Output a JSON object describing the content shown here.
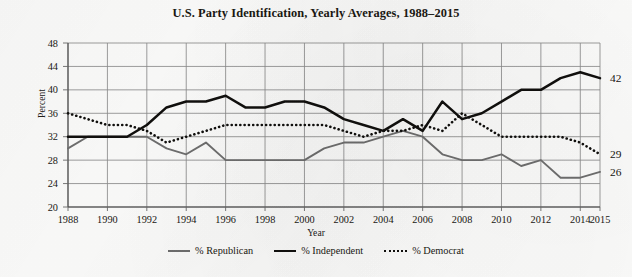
{
  "chart_data": {
    "type": "line",
    "title": "U.S. Party Identification, Yearly Averages, 1988–2015",
    "xlabel": "Year",
    "ylabel": "Percent",
    "ylim": [
      20,
      48
    ],
    "yticks": [
      20,
      24,
      28,
      32,
      36,
      40,
      44,
      48
    ],
    "xlim": [
      1988,
      2015
    ],
    "xticks": [
      1988,
      1990,
      1992,
      1994,
      1996,
      1998,
      2000,
      2002,
      2004,
      2006,
      2008,
      2010,
      2012,
      2014,
      2015
    ],
    "xtick_labels": [
      "1988",
      "1990",
      "1992",
      "1994",
      "1996",
      "1998",
      "2000",
      "2002",
      "2004",
      "2006",
      "2008",
      "2010",
      "2012",
      "2014",
      "2015"
    ],
    "grid": true,
    "legend_position": "bottom",
    "x": [
      1988,
      1989,
      1990,
      1991,
      1992,
      1993,
      1994,
      1995,
      1996,
      1997,
      1998,
      1999,
      2000,
      2001,
      2002,
      2003,
      2004,
      2005,
      2006,
      2007,
      2008,
      2009,
      2010,
      2011,
      2012,
      2013,
      2014,
      2015
    ],
    "series": [
      {
        "name": "% Republican",
        "color": "#6f6f6f",
        "style": "solid",
        "end_label": "26",
        "values": [
          30,
          32,
          32,
          32,
          32,
          30,
          29,
          31,
          28,
          28,
          28,
          28,
          28,
          30,
          31,
          31,
          32,
          33,
          32,
          29,
          28,
          28,
          29,
          27,
          28,
          25,
          25,
          26
        ]
      },
      {
        "name": "% Independent",
        "color": "#100f0d",
        "style": "solid",
        "end_label": "42",
        "values": [
          32,
          32,
          32,
          32,
          34,
          37,
          38,
          38,
          39,
          37,
          37,
          38,
          38,
          37,
          35,
          34,
          33,
          35,
          33,
          38,
          35,
          36,
          38,
          40,
          40,
          42,
          43,
          42
        ]
      },
      {
        "name": "% Democrat",
        "color": "#100f0d",
        "style": "dotted",
        "end_label": "29",
        "values": [
          36,
          35,
          34,
          34,
          33,
          31,
          32,
          33,
          34,
          34,
          34,
          34,
          34,
          34,
          33,
          32,
          33,
          33,
          34,
          33,
          36,
          34,
          32,
          32,
          32,
          32,
          31,
          29
        ]
      }
    ]
  },
  "legend": {
    "items": [
      {
        "label": "% Republican"
      },
      {
        "label": "% Independent"
      },
      {
        "label": "% Democrat"
      }
    ]
  }
}
